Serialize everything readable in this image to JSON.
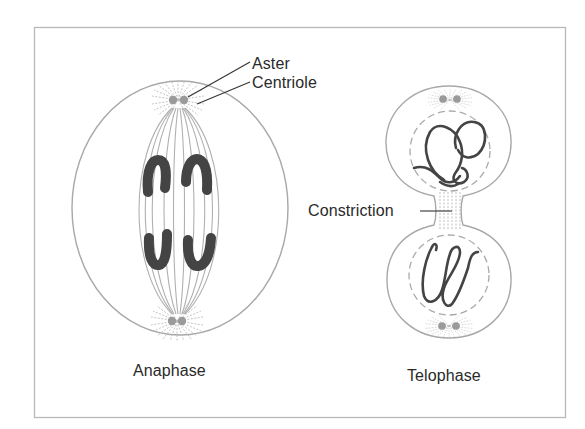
{
  "figure": {
    "labels": {
      "aster": "Aster",
      "centriole": "Centriole",
      "constriction": "Constriction",
      "anaphase": "Anaphase",
      "telophase": "Telophase"
    },
    "colors": {
      "frame": "#b8b8b8",
      "cell_outline": "#a8a8a8",
      "spindle": "#b0b0b0",
      "aster_rays": "#bdbdbd",
      "centriole": "#9a9a9a",
      "chromosome": "#444444",
      "leader_line": "#333333",
      "text": "#2a2a2a"
    },
    "panels": [
      {
        "name": "anaphase",
        "caption": "Anaphase"
      },
      {
        "name": "telophase",
        "caption": "Telophase"
      }
    ]
  }
}
